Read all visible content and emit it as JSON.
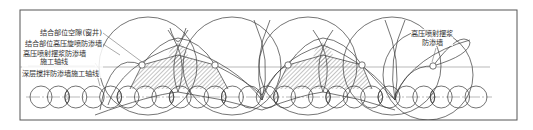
{
  "diagram": {
    "colors": {
      "line": "#3a3a3a",
      "axis": "#8a8a8a",
      "hatch": "#555555",
      "border": "#555555",
      "background": "#ffffff"
    },
    "labels": {
      "joint_gap": "结合部位空隙(窗井)",
      "joint_rotary_jet_wall": "结合部位高压旋喷防渗墙",
      "swing_jet_wall": "高压喷射摆浆防渗墙",
      "construction_axis": "施工轴线",
      "deep_mixing_axis": "深层搅拌防渗墙施工轴线",
      "right_wall_line1": "高压喷射摆浆",
      "right_wall_line2": "防渗墙"
    },
    "geometry": {
      "upper_axis_y": 67,
      "lower_axis_y": 97,
      "small_circle_radius": 11,
      "small_circle_spacing": 17.4,
      "big_circle_radius": 49,
      "node_radius": 3.2
    }
  }
}
